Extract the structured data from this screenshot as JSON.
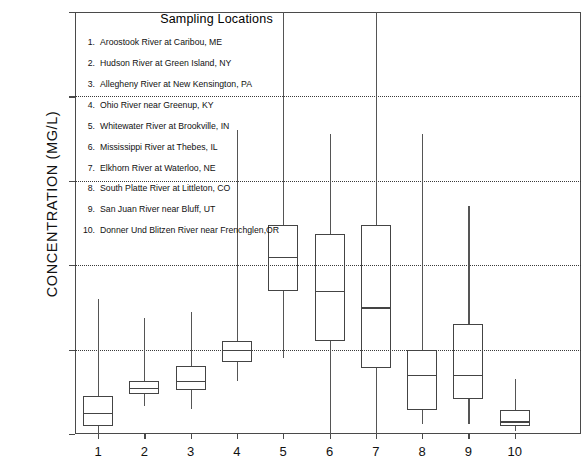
{
  "chart_data": {
    "type": "box",
    "title": "",
    "xlabel": "",
    "ylabel": "CONCENTRATION (MG/L)",
    "ylim": [
      0,
      5
    ],
    "ytick_labels": [
      "0",
      "1",
      "2",
      "3",
      "4",
      "5"
    ],
    "ytick_values": [
      0,
      1,
      2,
      3,
      4,
      5
    ],
    "gridlines": [
      1,
      2,
      3,
      4
    ],
    "grid": true,
    "legend_position": "inside-top-left",
    "categories": [
      "1",
      "2",
      "3",
      "4",
      "5",
      "6",
      "7",
      "8",
      "9",
      "10"
    ],
    "boxes": [
      {
        "category": "1",
        "whisker_low": 0.0,
        "q1": 0.1,
        "median": 0.25,
        "q3": 0.45,
        "whisker_high": 1.6
      },
      {
        "category": "2",
        "whisker_low": 0.33,
        "q1": 0.47,
        "median": 0.55,
        "q3": 0.63,
        "whisker_high": 1.38
      },
      {
        "category": "3",
        "whisker_low": 0.3,
        "q1": 0.52,
        "median": 0.63,
        "q3": 0.8,
        "whisker_high": 1.45
      },
      {
        "category": "4",
        "whisker_low": 0.63,
        "q1": 0.85,
        "median": 1.0,
        "q3": 1.1,
        "whisker_high": 3.6
      },
      {
        "category": "5",
        "whisker_low": 0.9,
        "q1": 1.7,
        "median": 2.1,
        "q3": 2.48,
        "whisker_high": 5.0
      },
      {
        "category": "6",
        "whisker_low": 0.0,
        "q1": 1.1,
        "median": 1.7,
        "q3": 2.37,
        "whisker_high": 3.55
      },
      {
        "category": "7",
        "whisker_low": 0.0,
        "q1": 0.78,
        "median": 1.5,
        "q3": 2.48,
        "whisker_high": 5.0
      },
      {
        "category": "8",
        "whisker_low": 0.12,
        "q1": 0.28,
        "median": 0.7,
        "q3": 1.0,
        "whisker_high": 3.55
      },
      {
        "category": "9",
        "whisker_low": 0.12,
        "q1": 0.42,
        "median": 0.7,
        "q3": 1.3,
        "whisker_high": 2.7
      },
      {
        "category": "10",
        "whisker_low": 0.04,
        "q1": 0.1,
        "median": 0.15,
        "q3": 0.28,
        "whisker_high": 0.65
      }
    ]
  },
  "legend": {
    "title": "Sampling Locations",
    "items": [
      {
        "num": "1.",
        "label": "Aroostook River at Caribou, ME"
      },
      {
        "num": "2.",
        "label": "Hudson River at Green Island, NY"
      },
      {
        "num": "3.",
        "label": "Allegheny River at New Kensington, PA"
      },
      {
        "num": "4.",
        "label": "Ohio River near Greenup, KY"
      },
      {
        "num": "5.",
        "label": "Whitewater River at Brookville, IN"
      },
      {
        "num": "6.",
        "label": "Mississippi River at Thebes, IL"
      },
      {
        "num": "7.",
        "label": "Elkhorn River at Waterloo, NE"
      },
      {
        "num": "8.",
        "label": "South Platte River at Littleton, CO"
      },
      {
        "num": "9.",
        "label": "San Juan River near Bluff, UT"
      },
      {
        "num": "10.",
        "label": "Donner Und Blitzen River near Frenchglen,OR"
      }
    ]
  },
  "colors": {
    "axis": "#4a4a4a",
    "box_stroke": "#444444",
    "whisker": "#555555",
    "grid": "#3a3a3a",
    "background": "#ffffff"
  }
}
